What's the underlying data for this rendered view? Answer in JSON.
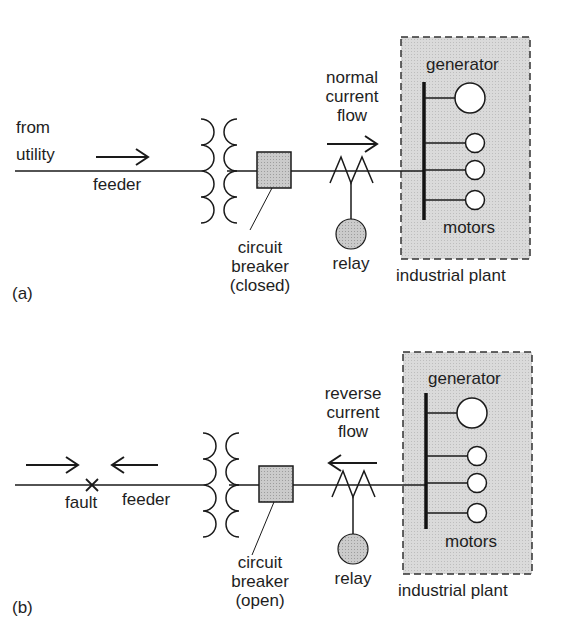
{
  "figure": {
    "panel_a": {
      "tag": "(a)",
      "source_line1": "from",
      "source_line2": "utility",
      "feeder": "feeder",
      "breaker_line1": "circuit",
      "breaker_line2": "breaker",
      "breaker_state": "(closed)",
      "flow_line1": "normal",
      "flow_line2": "current",
      "flow_line3": "flow",
      "relay": "relay",
      "generator": "generator",
      "motors": "motors",
      "plant": "industrial plant",
      "flow_direction": "right"
    },
    "panel_b": {
      "tag": "(b)",
      "fault": "fault",
      "feeder": "feeder",
      "breaker_line1": "circuit",
      "breaker_line2": "breaker",
      "breaker_state": "(open)",
      "flow_line1": "reverse",
      "flow_line2": "current",
      "flow_line3": "flow",
      "relay": "relay",
      "generator": "generator",
      "motors": "motors",
      "plant": "industrial plant",
      "flow_direction": "left"
    },
    "colors": {
      "line": "#1a1a1a",
      "plant_fill": "#d9d9d9",
      "breaker_fill": "#c8c8c8",
      "relay_fill": "#c4c4c4"
    }
  }
}
